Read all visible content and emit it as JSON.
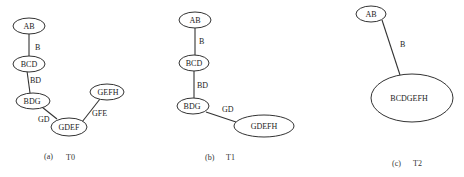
{
  "panels": [
    {
      "id": "a",
      "caption_letter": "(a)",
      "caption_title": "T0",
      "nodes": [
        {
          "id": "AB",
          "label": "AB"
        },
        {
          "id": "BCD",
          "label": "BCD"
        },
        {
          "id": "BDG",
          "label": "BDG"
        },
        {
          "id": "GDEF",
          "label": "GDEF"
        },
        {
          "id": "GEFH",
          "label": "GEFH"
        }
      ],
      "edges": [
        {
          "from": "AB",
          "to": "BCD",
          "label": "B"
        },
        {
          "from": "BCD",
          "to": "BDG",
          "label": "BD"
        },
        {
          "from": "BDG",
          "to": "GDEF",
          "label": "GD"
        },
        {
          "from": "GDEF",
          "to": "GEFH",
          "label": "GFE"
        }
      ]
    },
    {
      "id": "b",
      "caption_letter": "(b)",
      "caption_title": "T1",
      "nodes": [
        {
          "id": "AB",
          "label": "AB"
        },
        {
          "id": "BCD",
          "label": "BCD"
        },
        {
          "id": "BDG",
          "label": "BDG"
        },
        {
          "id": "GDEFH",
          "label": "GDEFH"
        }
      ],
      "edges": [
        {
          "from": "AB",
          "to": "BCD",
          "label": "B"
        },
        {
          "from": "BCD",
          "to": "BDG",
          "label": "BD"
        },
        {
          "from": "BDG",
          "to": "GDEFH",
          "label": "GD"
        }
      ]
    },
    {
      "id": "c",
      "caption_letter": "(c)",
      "caption_title": "T2",
      "nodes": [
        {
          "id": "AB",
          "label": "AB"
        },
        {
          "id": "BCDGEFH",
          "label": "BCDGEFH"
        }
      ],
      "edges": [
        {
          "from": "AB",
          "to": "BCDGEFH",
          "label": "B"
        }
      ]
    }
  ]
}
